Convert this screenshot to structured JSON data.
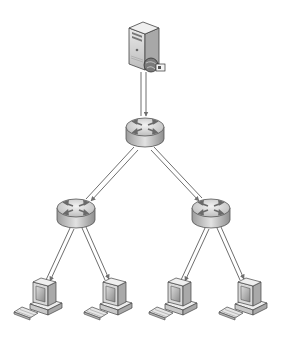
{
  "diagram": {
    "type": "network-topology",
    "colors": {
      "background": "#ffffff",
      "link": "#6f6f6f",
      "router_top": "#d9d9d9",
      "router_side": "#b3b3b3",
      "router_arrows": "#6a6a6a",
      "server_body": "#d6d6d6",
      "pc_body": "#d0d0d0",
      "screen": "#9a9a9a"
    },
    "nodes": [
      {
        "id": "server",
        "kind": "server",
        "x": 143,
        "y": 50
      },
      {
        "id": "core-router",
        "kind": "router",
        "x": 145,
        "y": 132
      },
      {
        "id": "left-router",
        "kind": "router",
        "x": 76,
        "y": 213
      },
      {
        "id": "right-router",
        "kind": "router",
        "x": 211,
        "y": 213
      },
      {
        "id": "pc-1",
        "kind": "workstation",
        "x": 40,
        "y": 300
      },
      {
        "id": "pc-2",
        "kind": "workstation",
        "x": 110,
        "y": 300
      },
      {
        "id": "pc-3",
        "kind": "workstation",
        "x": 175,
        "y": 300
      },
      {
        "id": "pc-4",
        "kind": "workstation",
        "x": 245,
        "y": 300
      }
    ],
    "links": [
      {
        "from": "server",
        "to": "core-router"
      },
      {
        "from": "core-router",
        "to": "left-router"
      },
      {
        "from": "core-router",
        "to": "right-router"
      },
      {
        "from": "left-router",
        "to": "pc-1"
      },
      {
        "from": "left-router",
        "to": "pc-2"
      },
      {
        "from": "right-router",
        "to": "pc-3"
      },
      {
        "from": "right-router",
        "to": "pc-4"
      }
    ]
  }
}
